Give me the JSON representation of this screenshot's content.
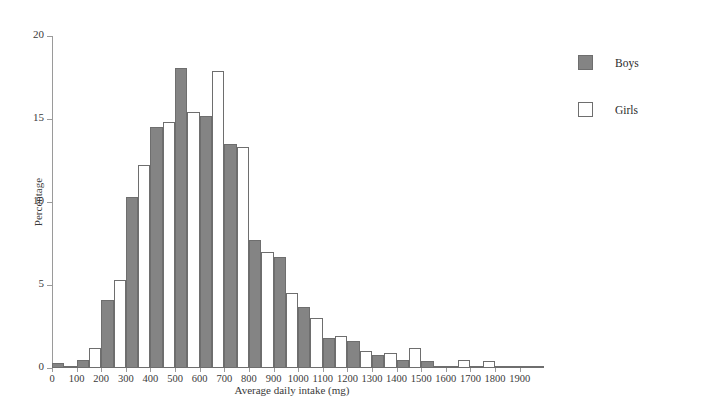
{
  "figure": {
    "cropped_caption": "",
    "legend": {
      "position": "right",
      "entries": [
        {
          "label": "Boys",
          "swatch": "filled-gray-square",
          "color": "#848484"
        },
        {
          "label": "Girls",
          "swatch": "hollow-white-square",
          "color": "#ffffff"
        }
      ]
    }
  },
  "chart_data": {
    "type": "bar",
    "title": "",
    "subtitle": "",
    "xlabel": "Average daily intake (mg)",
    "ylabel": "Percentage",
    "xlim": [
      0,
      1950
    ],
    "ylim": [
      0,
      20
    ],
    "yticks": [
      0,
      5,
      10,
      15,
      20
    ],
    "xticks": [
      0,
      100,
      200,
      300,
      400,
      500,
      600,
      700,
      800,
      900,
      1000,
      1100,
      1200,
      1300,
      1400,
      1500,
      1600,
      1700,
      1800,
      1900
    ],
    "grid": false,
    "bin_width": 100,
    "bar_layout": "grouped-pairs-per-bin",
    "categories": [
      "0-100",
      "100-200",
      "200-300",
      "300-400",
      "400-500",
      "500-600",
      "600-700",
      "700-800",
      "800-900",
      "900-1000",
      "1000-1100",
      "1100-1200",
      "1200-1300",
      "1300-1400",
      "1400-1500",
      "1500-1600",
      "1600-1700",
      "1700-1800",
      "1800-1900",
      "1900-2000"
    ],
    "bin_starts": [
      0,
      100,
      200,
      300,
      400,
      500,
      600,
      700,
      800,
      900,
      1000,
      1100,
      1200,
      1300,
      1400,
      1500,
      1600,
      1700,
      1800,
      1900
    ],
    "series": [
      {
        "name": "Boys",
        "color": "#848484",
        "values": [
          0.3,
          0.5,
          4.1,
          10.3,
          14.5,
          18.1,
          15.2,
          13.5,
          7.7,
          6.7,
          3.7,
          1.8,
          1.6,
          0.8,
          0.5,
          0.4,
          0.05,
          0.05,
          0.1,
          0.05
        ]
      },
      {
        "name": "Girls",
        "color": "#ffffff",
        "values": [
          0.1,
          1.2,
          5.3,
          12.2,
          14.8,
          15.4,
          17.9,
          13.3,
          7.0,
          4.5,
          3.0,
          1.9,
          1.0,
          0.9,
          1.2,
          0.05,
          0.5,
          0.45,
          0.15,
          0.1
        ]
      }
    ]
  }
}
